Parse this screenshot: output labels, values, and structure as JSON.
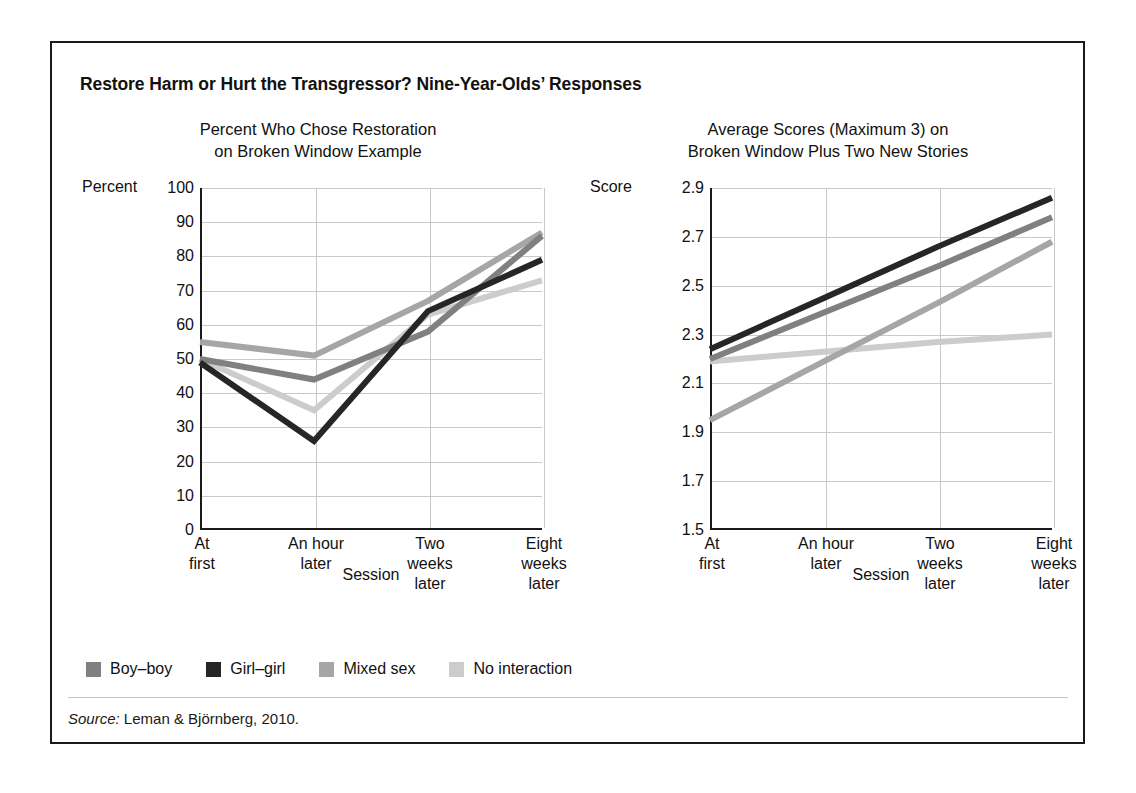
{
  "figure": {
    "title": "Restore Harm or Hurt the Transgressor? Nine-Year-Olds’ Responses",
    "source_keyword": "Source:",
    "source_text": " Leman & Björnberg, 2010."
  },
  "legend": {
    "position": "bottom-left",
    "items": [
      {
        "label": "Boy–boy",
        "color": "#808080"
      },
      {
        "label": "Girl–girl",
        "color": "#262626"
      },
      {
        "label": "Mixed sex",
        "color": "#a6a6a6"
      },
      {
        "label": "No interaction",
        "color": "#cccccc"
      }
    ]
  },
  "chart_data": [
    {
      "id": "left",
      "type": "line",
      "title": "Percent Who Chose Restoration on Broken Window Example",
      "title_line1": "Percent Who Chose Restoration",
      "title_line2": "on Broken Window Example",
      "ylabel": "Percent",
      "xlabel": "Session",
      "categories": [
        "At first",
        "An hour later",
        "Two weeks later",
        "Eight weeks later"
      ],
      "category_lines": [
        [
          "At",
          "first"
        ],
        [
          "An hour",
          "later"
        ],
        [
          "Two",
          "weeks",
          "later"
        ],
        [
          "Eight",
          "weeks",
          "later"
        ]
      ],
      "ylim": [
        0,
        100
      ],
      "yticks": [
        0,
        10,
        20,
        30,
        40,
        50,
        60,
        70,
        80,
        90,
        100
      ],
      "grid": true,
      "series": [
        {
          "name": "Boy–boy",
          "color": "#808080",
          "values": [
            50,
            44,
            58,
            86
          ]
        },
        {
          "name": "Girl–girl",
          "color": "#262626",
          "values": [
            49,
            26,
            64,
            79
          ]
        },
        {
          "name": "Mixed sex",
          "color": "#a6a6a6",
          "values": [
            55,
            51,
            67,
            87
          ]
        },
        {
          "name": "No interaction",
          "color": "#cccccc",
          "values": [
            50,
            35,
            63,
            73
          ]
        }
      ]
    },
    {
      "id": "right",
      "type": "line",
      "title": "Average Scores (Maximum 3) on Broken Window Plus Two New Stories",
      "title_line1": "Average Scores (Maximum 3) on",
      "title_line2": "Broken Window Plus Two New Stories",
      "ylabel": "Score",
      "xlabel": "Session",
      "categories": [
        "At first",
        "An hour later",
        "Two weeks later",
        "Eight weeks later"
      ],
      "category_lines": [
        [
          "At",
          "first"
        ],
        [
          "An hour",
          "later"
        ],
        [
          "Two",
          "weeks",
          "later"
        ],
        [
          "Eight",
          "weeks",
          "later"
        ]
      ],
      "ylim": [
        1.5,
        2.9
      ],
      "yticks": [
        1.5,
        1.7,
        1.9,
        2.1,
        2.3,
        2.5,
        2.7,
        2.9
      ],
      "grid": true,
      "series": [
        {
          "name": "Boy–boy",
          "color": "#808080",
          "values": [
            2.2,
            2.39,
            2.58,
            2.78
          ]
        },
        {
          "name": "Girl–girl",
          "color": "#262626",
          "values": [
            2.24,
            2.45,
            2.66,
            2.86
          ]
        },
        {
          "name": "Mixed sex",
          "color": "#a6a6a6",
          "values": [
            1.95,
            2.19,
            2.43,
            2.68
          ]
        },
        {
          "name": "No interaction",
          "color": "#cccccc",
          "values": [
            2.19,
            2.23,
            2.27,
            2.3
          ]
        }
      ]
    }
  ]
}
